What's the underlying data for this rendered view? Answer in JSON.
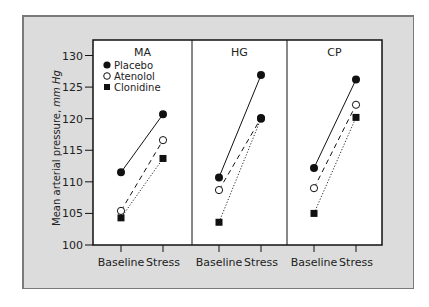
{
  "chart_data": {
    "type": "line",
    "ylabel": "Mean arterial pressure,",
    "ylabel_unit": "mm Hg",
    "ylim": [
      100,
      130
    ],
    "yticks": [
      100,
      105,
      110,
      115,
      120,
      125,
      130
    ],
    "categories": [
      "Baseline",
      "Stress"
    ],
    "legend": [
      {
        "name": "Placebo",
        "marker": "filled-circle",
        "line": "solid"
      },
      {
        "name": "Atenolol",
        "marker": "open-circle",
        "line": "dashed"
      },
      {
        "name": "Clonidine",
        "marker": "filled-square",
        "line": "dotted"
      }
    ],
    "panels": [
      {
        "title": "MA",
        "series": [
          {
            "name": "Placebo",
            "values": [
              111.5,
              120.7
            ]
          },
          {
            "name": "Atenolol",
            "values": [
              105.4,
              116.6
            ]
          },
          {
            "name": "Clonidine",
            "values": [
              104.3,
              113.7
            ]
          }
        ]
      },
      {
        "title": "HG",
        "series": [
          {
            "name": "Placebo",
            "values": [
              110.7,
              126.9
            ]
          },
          {
            "name": "Atenolol",
            "values": [
              108.7,
              120.1
            ]
          },
          {
            "name": "Clonidine",
            "values": [
              103.6,
              120.0
            ]
          }
        ]
      },
      {
        "title": "CP",
        "series": [
          {
            "name": "Placebo",
            "values": [
              112.2,
              126.2
            ]
          },
          {
            "name": "Atenolol",
            "values": [
              109.0,
              122.2
            ]
          },
          {
            "name": "Clonidine",
            "values": [
              105.0,
              120.2
            ]
          }
        ]
      }
    ],
    "grid": false,
    "legend_position": "top-left of first panel"
  },
  "colors": {
    "frame_bg": "#dcdcdc",
    "frame_border": "#7a7a7a",
    "plot_bg": "#ffffff",
    "ink": "#111111"
  }
}
